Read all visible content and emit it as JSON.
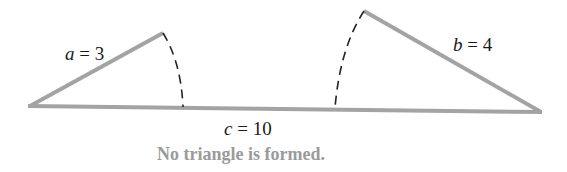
{
  "diagram": {
    "sides": {
      "a": {
        "name": "a",
        "value": "3"
      },
      "b": {
        "name": "b",
        "value": "4"
      },
      "c": {
        "name": "c",
        "value": "10"
      }
    },
    "caption": "No triangle is formed.",
    "colors": {
      "side": "#a3a3a3",
      "arc": "#222222",
      "caption": "#9a9a9a"
    }
  }
}
